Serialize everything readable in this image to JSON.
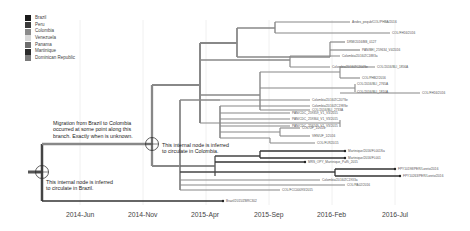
{
  "legend": {
    "items": [
      {
        "label": "Brazil",
        "color": "#1a1a1a"
      },
      {
        "label": "Peru",
        "color": "#3a3a3a"
      },
      {
        "label": "Colombia",
        "color": "#8a8a8a"
      },
      {
        "label": "Venezuela",
        "color": "#d8d8d8"
      },
      {
        "label": "Panama",
        "color": "#6e6e6e"
      },
      {
        "label": "Martinique",
        "color": "#2a2a2a"
      },
      {
        "label": "Dominican Republic",
        "color": "#7a7a7a"
      }
    ]
  },
  "annotations": {
    "migration": [
      "Migration from Brazil to Colombia",
      "occurred at some point along this",
      "branch. Exactly when is unknown."
    ],
    "colombia_node": [
      "This internal node is inferred",
      "to circulate in Colombia."
    ],
    "brazil_node": [
      "This internal node is inferred",
      "to circulate in Brazil."
    ]
  },
  "axis": {
    "ticks": [
      "2014-Jun",
      "2014-Nov",
      "2015-Apr",
      "2015-Sep",
      "2016-Feb",
      "2016-Jul"
    ]
  },
  "leaves": [
    "Andes_pequb/COL/PHBA/2016",
    "COL/FH16/2016",
    "DRM/2016/BB_0127",
    "PAN/BEI_259634_V4/2016",
    "Colombia/2016/ZC1883a",
    "Colombia/2016/ZC204Se",
    "COL/2016/BLI_1856A",
    "COL/PHB2/2016",
    "COL/2016/BLI_2765A",
    "COL/2016/BLI_1810A",
    "COL/2016/BLI_2733A",
    "COL/FH16/2016",
    "Colombia/2016/ZC207Se",
    "Colombia/2016/ZC198Se",
    "PAN/CDC_259359_V1_V3/2015",
    "PAN/CDC_259364_V1_V3/2015",
    "PAN/CDC_259249_V1_V3/2015",
    "COL/UF_1/2016",
    "VEN/UF_1/2016",
    "COL/FLR/2015",
    "Martinique/2016/FL001Sa",
    "Martinique/2016/FL001",
    "MRS_OPY_Martinique_PaRi_2015",
    "FPY10198/PER/Loreto/2016",
    "FPY10263/PER/Loreto/2016",
    "Colombia/2016/ZC1933a",
    "COL/PA02/2016",
    "COL/FCC00093/2015",
    "Brazil/2015/ZBRC302"
  ]
}
